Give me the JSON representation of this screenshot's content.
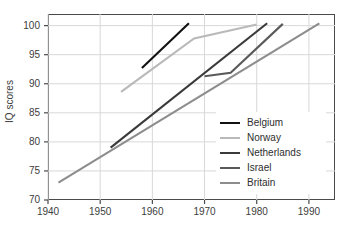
{
  "chart_data": {
    "type": "line",
    "title": "",
    "xlabel": "",
    "ylabel": "IQ scores",
    "xlim": [
      1940,
      1995
    ],
    "ylim": [
      70,
      102
    ],
    "xticks": [
      1940,
      1950,
      1960,
      1970,
      1980,
      1990
    ],
    "yticks": [
      70,
      75,
      80,
      85,
      90,
      95,
      100
    ],
    "grid": true,
    "legend_position": "lower-right-inside",
    "series": [
      {
        "name": "Belgium",
        "color": "#111111",
        "x": [
          1958,
          1967
        ],
        "values": [
          92.7,
          100.4
        ]
      },
      {
        "name": "Norway",
        "color": "#b9b9b9",
        "x": [
          1954,
          1968,
          1980
        ],
        "values": [
          88.6,
          97.8,
          100.2
        ]
      },
      {
        "name": "Netherlands",
        "color": "#3a3a3a",
        "x": [
          1952,
          1982
        ],
        "values": [
          79.0,
          100.4
        ]
      },
      {
        "name": "Israel",
        "color": "#5a5a5a",
        "x": [
          1970,
          1975,
          1985
        ],
        "values": [
          91.3,
          91.9,
          100.3
        ]
      },
      {
        "name": "Britain",
        "color": "#8d8d8d",
        "x": [
          1942,
          1992
        ],
        "values": [
          73.0,
          100.4
        ]
      }
    ]
  },
  "axes": {
    "ylabel": "IQ scores",
    "ytick_labels": [
      "100",
      "95",
      "90",
      "85",
      "80",
      "75",
      "70"
    ],
    "xtick_labels": [
      "1940",
      "1950",
      "1960",
      "1970",
      "1980",
      "1990"
    ]
  },
  "legend": {
    "items": [
      {
        "label": "Belgium",
        "color": "#111111"
      },
      {
        "label": "Norway",
        "color": "#b9b9b9"
      },
      {
        "label": "Netherlands",
        "color": "#3a3a3a"
      },
      {
        "label": "Israel",
        "color": "#5a5a5a"
      },
      {
        "label": "Britain",
        "color": "#8d8d8d"
      }
    ]
  },
  "style": {
    "background": "#ffffff",
    "grid_color": "#d8d8d8",
    "frame_color": "#4a4a4a",
    "text_color": "#3d3d3d"
  }
}
